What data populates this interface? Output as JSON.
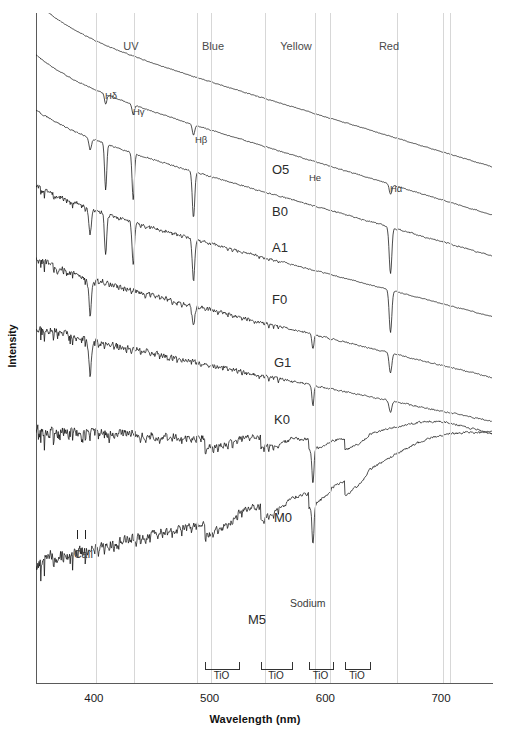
{
  "chart_data": {
    "type": "line",
    "xlabel": "Wavelength (nm)",
    "ylabel": "Intensity",
    "xlim": [
      350,
      744
    ],
    "xticks": [
      400,
      500,
      600,
      700
    ],
    "xticklabels": [
      "400",
      "500",
      "600",
      "700"
    ],
    "grid": "vertical-only",
    "legend": "inline-right-of-each-trace",
    "series": [
      {
        "name": "O5",
        "label_x": 272,
        "label_y": 162,
        "baseline_y": 30,
        "slope": 0.3,
        "noise": 0.8,
        "lines": []
      },
      {
        "name": "B0",
        "label_x": 272,
        "label_y": 204,
        "baseline_y": 78,
        "slope": 0.3,
        "noise": 1.0,
        "lines": [
          "H-delta",
          "H-gamma",
          "H-beta",
          "H-alpha"
        ]
      },
      {
        "name": "A1",
        "label_x": 272,
        "label_y": 240,
        "baseline_y": 128,
        "slope": 0.28,
        "noise": 1.4,
        "lines": [
          "H-delta",
          "H-gamma",
          "H-beta",
          "H-alpha",
          "CaII"
        ]
      },
      {
        "name": "F0",
        "label_x": 272,
        "label_y": 292,
        "baseline_y": 198,
        "slope": 0.26,
        "noise": 2.4,
        "lines": [
          "H-delta",
          "H-gamma",
          "H-beta",
          "H-alpha",
          "CaII"
        ]
      },
      {
        "name": "G1",
        "label_x": 274,
        "label_y": 355,
        "baseline_y": 268,
        "slope": 0.24,
        "noise": 3.6,
        "lines": [
          "CaII",
          "H-beta",
          "H-alpha",
          "Sodium"
        ]
      },
      {
        "name": "K0",
        "label_x": 274,
        "label_y": 412,
        "baseline_y": 330,
        "slope": 0.2,
        "noise": 4.2,
        "lines": [
          "CaII",
          "H-alpha",
          "Sodium"
        ]
      },
      {
        "name": "M0",
        "label_x": 274,
        "label_y": 510,
        "baseline_y": 430,
        "slope": 0.05,
        "noise": 6.0,
        "lines": [
          "TiO",
          "Sodium"
        ]
      },
      {
        "name": "M5",
        "label_x": 248,
        "label_y": 612,
        "baseline_y": 560,
        "slope": -0.22,
        "noise": 6.5,
        "lines": [
          "TiO",
          "Sodium"
        ]
      }
    ],
    "bands": [
      {
        "label": "UV",
        "center_x": 131
      },
      {
        "label": "Blue",
        "center_x": 213
      },
      {
        "label": "Yellow",
        "center_x": 296
      },
      {
        "label": "Red",
        "center_x": 389
      }
    ],
    "feature_gridlines_x": [
      96,
      134,
      197,
      211,
      265,
      315,
      330,
      397,
      443,
      450
    ],
    "annotations": [
      {
        "label": "Hδ",
        "x": 105,
        "y": 90,
        "kind": "hydrogen-line"
      },
      {
        "label": "Hγ",
        "x": 133,
        "y": 106,
        "kind": "hydrogen-line"
      },
      {
        "label": "Hβ",
        "x": 195,
        "y": 134,
        "kind": "hydrogen-line"
      },
      {
        "label": "Hα",
        "x": 390,
        "y": 183,
        "kind": "hydrogen-line"
      },
      {
        "label": "He",
        "x": 309,
        "y": 172,
        "kind": "helium-line"
      },
      {
        "label": "CaII",
        "x": 74,
        "y": 548,
        "kind": "calcium-line"
      },
      {
        "label": "Sodium",
        "x": 290,
        "y": 597,
        "kind": "sodium-line"
      }
    ],
    "tio_bands": [
      {
        "label": "TiO",
        "x1": 205,
        "x2": 238
      },
      {
        "label": "TiO",
        "x1": 261,
        "x2": 291
      },
      {
        "label": "TiO",
        "x1": 309,
        "x2": 332
      },
      {
        "label": "TiO",
        "x1": 345,
        "x2": 369
      }
    ]
  },
  "axes": {
    "x_title": "Wavelength (nm)",
    "y_title": "Intensity",
    "x_tick_labels": [
      "400",
      "500",
      "600",
      "700"
    ]
  },
  "colors": {
    "trace": "#111111",
    "gridline": "#d7d7d7",
    "axis": "#5a5a5a",
    "band_label": "#4a4a4a",
    "background": "#ffffff"
  }
}
